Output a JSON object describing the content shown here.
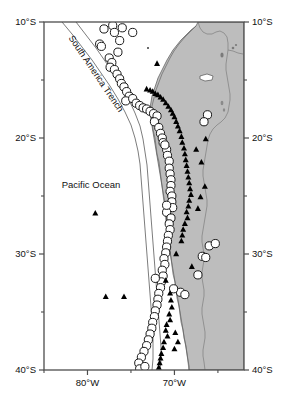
{
  "figure": {
    "type": "map",
    "title": "",
    "width": 284,
    "height": 403,
    "background_color": "#ffffff",
    "land_color": "#bdbdbd",
    "ocean_color": "#ffffff",
    "frame_color": "#4d4d4d",
    "coastline_color": "#555555",
    "border_color": "#777777",
    "circle_fill": "#ffffff",
    "circle_stroke": "#1a1a1a",
    "triangle_fill": "#000000"
  },
  "axes": {
    "x": {
      "label": "",
      "min_lon": -85.0,
      "max_lon": -62.0,
      "major_ticks": [
        {
          "value": -80,
          "label": "80°W"
        },
        {
          "value": -70,
          "label": "70°W"
        }
      ],
      "minor_ticks": [
        -85,
        -75,
        -65
      ],
      "pixel_left": 44,
      "pixel_right": 244
    },
    "y": {
      "label": "",
      "min_lat": -40.0,
      "max_lat": -10.0,
      "major_ticks": [
        {
          "value": -10,
          "label": "10°S"
        },
        {
          "value": -20,
          "label": "20°S"
        },
        {
          "value": -30,
          "label": "30°S"
        },
        {
          "value": -40,
          "label": "40°S"
        }
      ],
      "minor_ticks": [
        -15,
        -25,
        -35
      ],
      "pixel_top": 22,
      "pixel_bottom": 370,
      "left_labels": [
        "10°S",
        "20°S",
        "30°S",
        "40°S"
      ],
      "right_labels": [
        "10°S",
        "20°S",
        "30°S",
        "40°S"
      ]
    }
  },
  "annotations": [
    {
      "name": "south-america-trench",
      "text": "South America Trench",
      "lon": -79.3,
      "lat": -14.6,
      "rotation": 56
    },
    {
      "name": "pacific-ocean",
      "text": "Pacific Ocean",
      "lon": -79.6,
      "lat": -24.3,
      "rotation": 0
    }
  ],
  "chart_data": {
    "type": "scatter",
    "title": "",
    "xlabel": "",
    "ylabel": "",
    "xlim": [
      -85.0,
      -62.0
    ],
    "ylim": [
      -40.0,
      -10.0
    ],
    "grid": false,
    "legend": "none",
    "series": [
      {
        "name": "earthquakes",
        "marker": "open-circle",
        "fill": "#ffffff",
        "stroke": "#1a1a1a",
        "points": [
          [
            -78.1,
            -10.6
          ],
          [
            -77.1,
            -10.3
          ],
          [
            -76.9,
            -10.9
          ],
          [
            -76.3,
            -11.6
          ],
          [
            -78.6,
            -11.9
          ],
          [
            -78.4,
            -12.1
          ],
          [
            -76.0,
            -10.5
          ],
          [
            -77.5,
            -13.1
          ],
          [
            -77.2,
            -13.5
          ],
          [
            -77.4,
            -13.9
          ],
          [
            -76.9,
            -14.1
          ],
          [
            -76.6,
            -14.5
          ],
          [
            -76.3,
            -14.9
          ],
          [
            -76.1,
            -15.3
          ],
          [
            -75.8,
            -15.6
          ],
          [
            -75.5,
            -16.0
          ],
          [
            -75.2,
            -16.4
          ],
          [
            -75.6,
            -16.8
          ],
          [
            -74.8,
            -16.6
          ],
          [
            -74.4,
            -17.0
          ],
          [
            -74.0,
            -17.2
          ],
          [
            -73.6,
            -17.4
          ],
          [
            -73.2,
            -17.5
          ],
          [
            -72.8,
            -17.7
          ],
          [
            -72.4,
            -17.9
          ],
          [
            -72.0,
            -18.1
          ],
          [
            -72.3,
            -18.6
          ],
          [
            -71.8,
            -19.1
          ],
          [
            -71.6,
            -19.6
          ],
          [
            -71.4,
            -20.0
          ],
          [
            -71.3,
            -20.4
          ],
          [
            -66.2,
            -18.0
          ],
          [
            -66.6,
            -18.6
          ],
          [
            -70.9,
            -21.0
          ],
          [
            -70.8,
            -21.5
          ],
          [
            -70.6,
            -22.0
          ],
          [
            -70.6,
            -22.6
          ],
          [
            -70.5,
            -23.1
          ],
          [
            -70.4,
            -23.6
          ],
          [
            -70.4,
            -24.1
          ],
          [
            -70.5,
            -24.6
          ],
          [
            -70.3,
            -25.0
          ],
          [
            -70.3,
            -25.5
          ],
          [
            -70.2,
            -26.0
          ],
          [
            -70.9,
            -26.4
          ],
          [
            -70.4,
            -26.9
          ],
          [
            -70.6,
            -27.4
          ],
          [
            -70.5,
            -27.9
          ],
          [
            -70.7,
            -28.4
          ],
          [
            -70.8,
            -28.9
          ],
          [
            -70.9,
            -29.4
          ],
          [
            -71.0,
            -29.9
          ],
          [
            -71.2,
            -30.4
          ],
          [
            -71.1,
            -30.9
          ],
          [
            -71.4,
            -31.4
          ],
          [
            -71.3,
            -31.9
          ],
          [
            -71.5,
            -32.4
          ],
          [
            -72.2,
            -32.1
          ],
          [
            -71.6,
            -32.9
          ],
          [
            -71.8,
            -33.4
          ],
          [
            -71.9,
            -33.9
          ],
          [
            -72.0,
            -34.4
          ],
          [
            -72.2,
            -34.9
          ],
          [
            -72.3,
            -35.4
          ],
          [
            -72.5,
            -35.9
          ],
          [
            -72.6,
            -36.4
          ],
          [
            -72.8,
            -36.9
          ],
          [
            -73.0,
            -37.4
          ],
          [
            -73.2,
            -37.9
          ],
          [
            -73.5,
            -38.4
          ],
          [
            -73.8,
            -38.9
          ],
          [
            -74.1,
            -39.4
          ],
          [
            -74.0,
            -39.9
          ],
          [
            -73.4,
            -39.7
          ],
          [
            -66.0,
            -29.3
          ],
          [
            -65.3,
            -29.1
          ],
          [
            -66.8,
            -30.2
          ],
          [
            -66.4,
            -30.3
          ],
          [
            -67.3,
            -31.8
          ],
          [
            -69.3,
            -33.3
          ],
          [
            -68.8,
            -33.5
          ],
          [
            -70.1,
            -33.0
          ],
          [
            -74.8,
            -10.9
          ],
          [
            -76.5,
            -12.6
          ],
          [
            -71.1,
            -20.6
          ],
          [
            -70.9,
            -25.8
          ]
        ]
      },
      {
        "name": "volcanoes",
        "marker": "filled-triangle",
        "fill": "#000000",
        "points": [
          [
            -72.0,
            -13.6
          ],
          [
            -73.2,
            -15.8
          ],
          [
            -72.8,
            -15.9
          ],
          [
            -72.5,
            -16.0
          ],
          [
            -72.2,
            -16.2
          ],
          [
            -71.9,
            -16.3
          ],
          [
            -71.6,
            -16.5
          ],
          [
            -71.3,
            -16.7
          ],
          [
            -71.0,
            -17.0
          ],
          [
            -70.7,
            -17.3
          ],
          [
            -70.4,
            -17.6
          ],
          [
            -70.2,
            -17.9
          ],
          [
            -70.0,
            -18.2
          ],
          [
            -69.8,
            -18.6
          ],
          [
            -69.6,
            -19.0
          ],
          [
            -69.4,
            -19.4
          ],
          [
            -69.2,
            -19.9
          ],
          [
            -69.1,
            -20.4
          ],
          [
            -68.9,
            -20.9
          ],
          [
            -68.8,
            -21.4
          ],
          [
            -68.7,
            -21.9
          ],
          [
            -68.6,
            -22.4
          ],
          [
            -68.5,
            -22.9
          ],
          [
            -68.4,
            -23.4
          ],
          [
            -68.3,
            -23.9
          ],
          [
            -68.2,
            -24.4
          ],
          [
            -68.1,
            -24.9
          ],
          [
            -68.3,
            -25.4
          ],
          [
            -68.4,
            -25.9
          ],
          [
            -68.6,
            -26.4
          ],
          [
            -68.5,
            -26.9
          ],
          [
            -68.8,
            -27.4
          ],
          [
            -69.0,
            -27.9
          ],
          [
            -69.1,
            -28.4
          ],
          [
            -69.2,
            -28.9
          ],
          [
            -66.9,
            -22.1
          ],
          [
            -66.5,
            -24.2
          ],
          [
            -67.0,
            -25.1
          ],
          [
            -67.3,
            -26.1
          ],
          [
            -70.5,
            -33.4
          ],
          [
            -70.4,
            -34.0
          ],
          [
            -70.3,
            -34.6
          ],
          [
            -70.6,
            -35.2
          ],
          [
            -70.5,
            -35.7
          ],
          [
            -70.9,
            -36.1
          ],
          [
            -71.0,
            -36.6
          ],
          [
            -70.8,
            -37.1
          ],
          [
            -71.2,
            -37.6
          ],
          [
            -71.3,
            -38.1
          ],
          [
            -71.5,
            -38.6
          ],
          [
            -71.6,
            -39.0
          ],
          [
            -71.7,
            -39.4
          ],
          [
            -71.8,
            -39.8
          ],
          [
            -69.9,
            -36.8
          ],
          [
            -69.6,
            -37.6
          ],
          [
            -70.0,
            -38.2
          ],
          [
            -79.1,
            -26.5
          ],
          [
            -77.9,
            -33.7
          ],
          [
            -75.8,
            -33.7
          ],
          [
            -67.5,
            -21.0
          ],
          [
            -66.4,
            -20.1
          ],
          [
            -71.0,
            -32.3
          ],
          [
            -69.8,
            -30.0
          ],
          [
            -68.0,
            -31.1
          ]
        ]
      }
    ]
  }
}
